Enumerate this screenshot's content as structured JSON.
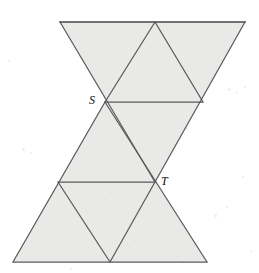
{
  "figure": {
    "background_color": "#ffffff",
    "fill_color": "#e9e9e7",
    "stroke_color": "#5a5a5a",
    "label_color": "#111111",
    "canvas": {
      "width": 259,
      "height": 273
    },
    "labels": [
      {
        "id": "S",
        "text": "S",
        "x": 105,
        "y": 102
      },
      {
        "id": "T",
        "text": "T",
        "x": 155,
        "y": 182
      }
    ],
    "vertices": {
      "top_left": {
        "x": 60,
        "y": 22
      },
      "top_mid": {
        "x": 155,
        "y": 22
      },
      "top_right": {
        "x": 245,
        "y": 22
      },
      "S": {
        "x": 105,
        "y": 102
      },
      "S_right": {
        "x": 203,
        "y": 102
      },
      "center": {
        "x": 155,
        "y": 22
      },
      "T_left": {
        "x": 58,
        "y": 182
      },
      "T": {
        "x": 155,
        "y": 182
      },
      "bottom_left": {
        "x": 13,
        "y": 262
      },
      "bottom_mid": {
        "x": 110,
        "y": 262
      },
      "bottom_right": {
        "x": 207,
        "y": 262
      }
    },
    "shaded_regions": [
      {
        "name": "upper-large-inverted-triangle",
        "points": "60,22 245,22 155,182"
      },
      {
        "name": "upper-inner-upright-triangle",
        "points": "105,102 203,102 155,22"
      },
      {
        "name": "lower-large-upright-triangle",
        "points": "13,262 207,262 105,102"
      },
      {
        "name": "lower-inner-inverted-triangle",
        "points": "58,182 155,182 110,262"
      }
    ],
    "edges": [
      {
        "name": "top-edge",
        "x1": 60,
        "y1": 22,
        "x2": 245,
        "y2": 22
      },
      {
        "name": "upper-left-edge",
        "x1": 60,
        "y1": 22,
        "x2": 155,
        "y2": 182
      },
      {
        "name": "upper-right-edge",
        "x1": 245,
        "y1": 22,
        "x2": 155,
        "y2": 182
      },
      {
        "name": "s-horizontal-edge",
        "x1": 105,
        "y1": 102,
        "x2": 203,
        "y2": 102
      },
      {
        "name": "inner-upper-left-edge",
        "x1": 105,
        "y1": 102,
        "x2": 155,
        "y2": 22
      },
      {
        "name": "inner-upper-right-edge",
        "x1": 203,
        "y1": 102,
        "x2": 155,
        "y2": 22
      },
      {
        "name": "bottom-edge",
        "x1": 13,
        "y1": 262,
        "x2": 207,
        "y2": 262
      },
      {
        "name": "lower-left-edge",
        "x1": 13,
        "y1": 262,
        "x2": 105,
        "y2": 102
      },
      {
        "name": "lower-right-edge",
        "x1": 207,
        "y1": 262,
        "x2": 105,
        "y2": 102
      },
      {
        "name": "t-horizontal-edge",
        "x1": 58,
        "y1": 182,
        "x2": 155,
        "y2": 182
      },
      {
        "name": "inner-lower-left-edge",
        "x1": 58,
        "y1": 182,
        "x2": 110,
        "y2": 262
      },
      {
        "name": "inner-lower-right-edge",
        "x1": 155,
        "y1": 182,
        "x2": 110,
        "y2": 262
      }
    ]
  }
}
